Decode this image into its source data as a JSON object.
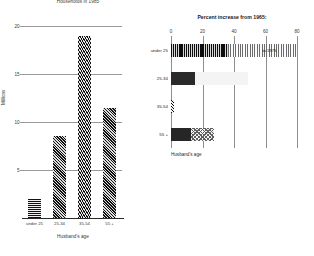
{
  "chart_data": [
    {
      "id": "households-1985",
      "type": "bar",
      "title": "Households in 1985",
      "xlabel": "Husband's age",
      "ylabel": "Millions",
      "categories": [
        "under 25",
        "25-34",
        "35-54",
        "55 +"
      ],
      "values": [
        2.0,
        8.5,
        19.0,
        11.5
      ],
      "ylim": [
        0,
        20
      ],
      "yticks": [
        5,
        10,
        15,
        20
      ],
      "ytick_labels": [
        "5",
        "10",
        "15",
        "20"
      ],
      "grid": true,
      "legend": "none",
      "orientation": "vertical"
    },
    {
      "id": "percent-increase-from-1965",
      "type": "bar",
      "title": "Percent increase from 1965:",
      "xlabel": "Husband's age",
      "ylabel": "",
      "orientation": "horizontal",
      "stacked": true,
      "categories": [
        "under 25",
        "25-34",
        "35-54",
        "55 +"
      ],
      "series": [
        {
          "name": "to 1975",
          "values": [
            36,
            15,
            2,
            13
          ]
        },
        {
          "name": "1975 to 1985",
          "values": [
            44,
            34,
            0,
            14
          ]
        }
      ],
      "totals": [
        80,
        49,
        2,
        27
      ],
      "xlim": [
        0,
        85
      ],
      "xticks": [
        0,
        20,
        40,
        60,
        80
      ],
      "xtick_labels": [
        "0",
        "20",
        "40",
        "60",
        "80"
      ],
      "annotations": [
        {
          "text": "to 1975",
          "category": "under 25",
          "value": 58
        }
      ],
      "grid": true,
      "legend": "none"
    }
  ],
  "left": {
    "title": "Households in 1985",
    "ylabel": "Millions",
    "xlabel": "Husband's age",
    "yticks": [
      "20",
      "15",
      "10",
      "5"
    ],
    "cats": [
      "under 25",
      "25-34",
      "35-54",
      "55 +"
    ]
  },
  "right": {
    "title": "Percent increase from 1965:",
    "xlabel": "Husband's age",
    "xticks": [
      "0",
      "20",
      "40",
      "60",
      "80"
    ],
    "cats": [
      "under 25",
      "25-34",
      "35-54",
      "55 +"
    ],
    "annot": "to 1975"
  }
}
